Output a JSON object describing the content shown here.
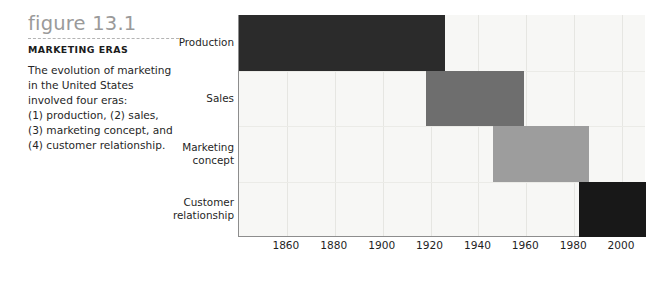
{
  "caption": {
    "figure_number": "figure 13.1",
    "heading": "MARKETING ERAS",
    "body_lines": [
      "The evolution of marketing",
      "in the United States",
      "involved four eras:",
      "(1) production, (2) sales,",
      "(3) marketing concept, and",
      "(4) customer relationship."
    ]
  },
  "colors": {
    "bar_production": "#2b2b2b",
    "bar_sales": "#6e6e6e",
    "bar_marketing_concept": "#9d9d9d",
    "bar_customer_relationship": "#181818",
    "plot_background": "#f7f7f5",
    "axis": "#8d8d8d",
    "gridline": "#e6e6e2",
    "figure_number_text": "#9a9a9a",
    "body_text": "#262626"
  },
  "chart_data": {
    "type": "bar",
    "orientation": "horizontal",
    "subtype": "timeline-gantt",
    "title": "MARKETING ERAS",
    "xlabel": "",
    "ylabel": "",
    "xlim": [
      1840,
      2010
    ],
    "grid": true,
    "legend": "none",
    "xticks": [
      1860,
      1880,
      1900,
      1920,
      1940,
      1960,
      1980,
      2000
    ],
    "xtick_labels": [
      "1860",
      "1880",
      "1900",
      "1920",
      "1940",
      "1960",
      "1980",
      "2000"
    ],
    "categories": [
      "Production",
      "Sales",
      "Marketing\nconcept",
      "Customer\nrelationship"
    ],
    "bars": [
      {
        "label": "Production",
        "start": 1840,
        "end": 1926,
        "color": "#2b2b2b"
      },
      {
        "label": "Sales",
        "start": 1918,
        "end": 1959,
        "color": "#6e6e6e"
      },
      {
        "label": "Marketing concept",
        "start": 1946,
        "end": 1986,
        "color": "#9d9d9d"
      },
      {
        "label": "Customer relationship",
        "start": 1982,
        "end": 2010,
        "color": "#181818"
      }
    ]
  }
}
